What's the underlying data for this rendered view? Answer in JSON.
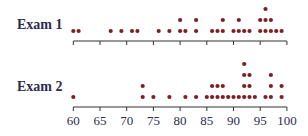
{
  "chart_data": {
    "type": "dot",
    "title": "",
    "xlabel": "",
    "ylabel": "",
    "xlim": [
      60,
      100
    ],
    "xticks": [
      60,
      65,
      70,
      75,
      80,
      85,
      90,
      95,
      100
    ],
    "xtick_labels": [
      "60",
      "65",
      "70",
      "75",
      "80",
      "85",
      "90",
      "95",
      "100"
    ],
    "grid": false,
    "legend": null,
    "dot_color": "#7b1f24",
    "axis_color": "#333333",
    "label_color": "#2b2b4e",
    "series": [
      {
        "name": "Exam 1",
        "counts": {
          "60": 1,
          "61": 1,
          "67": 1,
          "69": 1,
          "71": 1,
          "72": 1,
          "76": 1,
          "78": 1,
          "80": 2,
          "81": 1,
          "83": 2,
          "86": 1,
          "87": 1,
          "88": 2,
          "90": 1,
          "91": 2,
          "92": 1,
          "93": 1,
          "95": 2,
          "96": 3,
          "97": 2,
          "98": 1,
          "99": 1
        }
      },
      {
        "name": "Exam 2",
        "counts": {
          "60": 1,
          "73": 2,
          "75": 1,
          "78": 1,
          "81": 1,
          "83": 1,
          "85": 1,
          "86": 2,
          "87": 2,
          "88": 2,
          "89": 1,
          "90": 1,
          "91": 1,
          "92": 4,
          "93": 3,
          "94": 1,
          "96": 1,
          "97": 3,
          "99": 2
        }
      }
    ]
  },
  "labels": {
    "exam1": "Exam 1",
    "exam2": "Exam 2"
  }
}
